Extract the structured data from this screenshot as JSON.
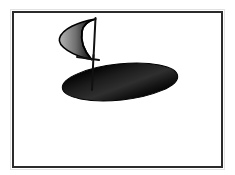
{
  "figure": {
    "title": "Sail and elliptical base diagram",
    "background_color": "#ffffff",
    "frame": {
      "name": "picture-frame",
      "stroke_color": "#2b2b2b",
      "stroke_width": 2,
      "x": 12,
      "y": 11,
      "width": 211,
      "height": 157,
      "fill": "#ffffff"
    },
    "shapes": {
      "ellipse_base": {
        "label": "elliptical base",
        "center_x": 120,
        "center_y": 82,
        "radius_x": 58,
        "radius_y": 18,
        "rotation_deg": -6,
        "fill_light": "#4a4a4a",
        "fill_dark": "#000000",
        "stroke_color": "#000000"
      },
      "sail": {
        "label": "crescent sail",
        "apex_x": 95,
        "apex_y": 19,
        "foot_x": 91,
        "foot_y": 60,
        "leading_edge_x": 59,
        "leading_edge_y": 38,
        "fill_light": "#9a9a9a",
        "fill_mid": "#6b6b6b",
        "fill_dark": "#000000",
        "stroke_color": "#000000",
        "stroke_width": 1.6
      },
      "mast": {
        "label": "mast",
        "top_x": 95,
        "top_y": 18,
        "bottom_x": 92,
        "bottom_y": 90,
        "stroke_color": "#111111",
        "stroke_width": 2
      },
      "boom": {
        "label": "boom crossbar",
        "x1": 77,
        "y1": 57,
        "x2": 99,
        "y2": 60,
        "stroke_color": "#111111",
        "stroke_width": 2
      }
    },
    "colors": {
      "ink": "#000000",
      "frame": "#2b2b2b",
      "paper": "#ffffff",
      "highlight_gray": "#9a9a9a"
    }
  }
}
